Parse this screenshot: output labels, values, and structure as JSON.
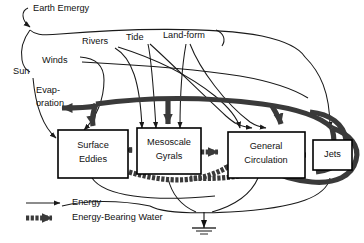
{
  "diagram": {
    "type": "energy-systems-flow-diagram",
    "colors": {
      "background": "#ffffff",
      "line": "#1a1a1a",
      "thick_water_flow": "#3a3a3a",
      "box_fill": "#ffffff",
      "box_stroke": "#000000",
      "text": "#111111"
    },
    "boxes": [
      {
        "id": "surface-eddies",
        "label_line1": "Surface",
        "label_line2": "Eddies"
      },
      {
        "id": "mesoscale-gyrals",
        "label_line1": "Mesoscale",
        "label_line2": "Gyrals"
      },
      {
        "id": "general-circulation",
        "label_line1": "General",
        "label_line2": "Circulation"
      },
      {
        "id": "jets",
        "label_line1": "Jets",
        "label_line2": ""
      }
    ],
    "sources": [
      {
        "id": "earth-emergy",
        "label": "Earth Emergy"
      },
      {
        "id": "sun",
        "label": "Sun"
      },
      {
        "id": "winds",
        "label": "Winds"
      },
      {
        "id": "rivers",
        "label": "Rivers"
      },
      {
        "id": "tide",
        "label": "Tide"
      },
      {
        "id": "land-form",
        "label": "Land-form"
      }
    ],
    "sinks": [
      {
        "id": "evaporation",
        "label_line1": "Evap-",
        "label_line2": "oration"
      },
      {
        "id": "heat-sink",
        "label": ""
      }
    ],
    "legend": {
      "items": [
        {
          "id": "energy",
          "label": "Energy",
          "style": "thin-arrow"
        },
        {
          "id": "energy-bearing-water",
          "label": "Energy-Bearing Water",
          "style": "thick-hatched-arrow"
        }
      ]
    }
  }
}
